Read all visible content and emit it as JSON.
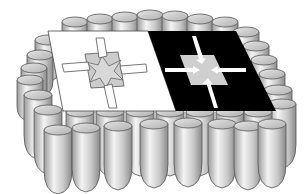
{
  "figure": {
    "colors": {
      "background": "#ffffff",
      "plate_left": "#ffffff",
      "plate_right": "#000000",
      "center_fill": "#cfcfcf",
      "pillar_light": "#f2f2f2",
      "pillar_dark": "#8a8a8a",
      "outline": "#444444"
    },
    "panels": [
      {
        "name": "left-panel",
        "fill": "white",
        "motif": "four-pointed star with inward arrows"
      },
      {
        "name": "right-panel",
        "fill": "black",
        "motif": "gray square with four inward arrows"
      }
    ],
    "pillars": {
      "shape": "rounded-cylinder",
      "count_front_row": 8
    }
  }
}
